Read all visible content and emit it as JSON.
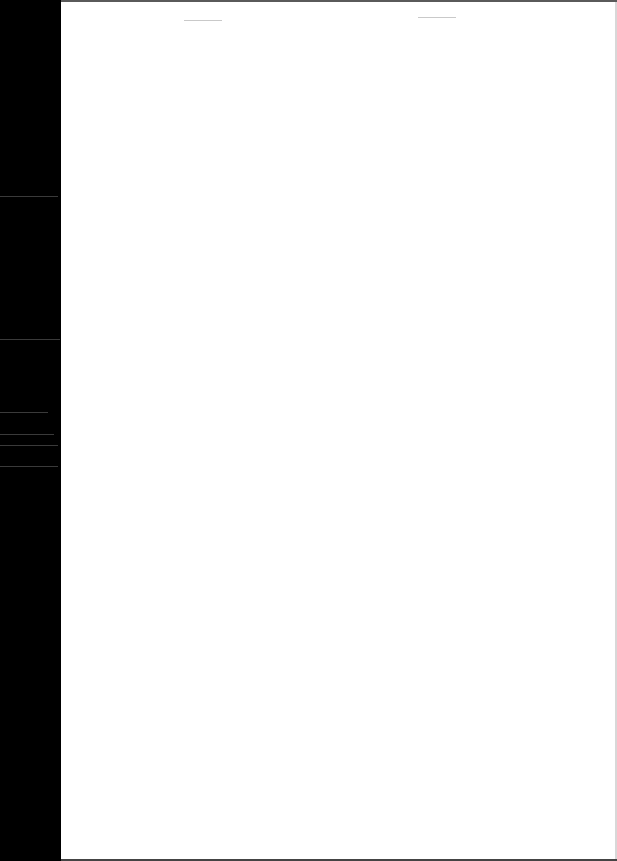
{
  "document": {
    "type": "scanned-page",
    "content": "",
    "colors": {
      "page": "#ffffff",
      "scanner_margin": "#000000"
    }
  }
}
